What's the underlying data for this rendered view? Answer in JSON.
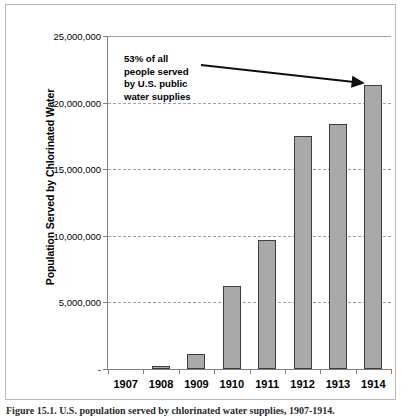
{
  "chart_data": {
    "type": "bar",
    "title": "",
    "xlabel": "",
    "ylabel": "Population Served by Chlorinated Water",
    "categories": [
      "1907",
      "1908",
      "1909",
      "1910",
      "1911",
      "1912",
      "1913",
      "1914"
    ],
    "values": [
      0,
      200000,
      1100000,
      6200000,
      9700000,
      17500000,
      18400000,
      21300000
    ],
    "ylim": [
      0,
      25000000
    ],
    "ytick_values": [
      0,
      5000000,
      10000000,
      15000000,
      20000000,
      25000000
    ],
    "ytick_labels": [
      "-",
      "5,000,000",
      "10,000,000",
      "15,000,000",
      "20,000,000",
      "25,000,000"
    ],
    "grid": true,
    "legend": "none",
    "bar_color": "#a9a9a9",
    "bar_border_color": "#3f3f3f",
    "gridline_color": "#9aa2ae",
    "axis_color": "#7f7f7f",
    "annotations": [
      {
        "name": "callout",
        "lines": [
          "53% of all",
          "people served",
          "by U.S. public",
          "water supplies"
        ],
        "points_to_category": "1914"
      }
    ]
  },
  "annotation": {
    "line1": "53% of all",
    "line2": "people served",
    "line3": "by U.S. public",
    "line4": "water supplies"
  },
  "caption": {
    "text": "Figure 15.1.  U.S. population served by chlorinated water supplies, 1907-1914."
  }
}
